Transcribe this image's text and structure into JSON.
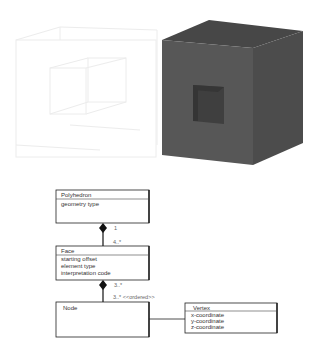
{
  "figure": {
    "wireframe_cube": {
      "label": "wireframe cube with hole",
      "stroke_color": "#e8e8e8"
    },
    "solid_cube": {
      "label": "solid cube with square hole",
      "front_color": "#555555",
      "top_color": "#4a4a4a",
      "side_color": "#4d4d4d",
      "hole_color": "#3e3e3e"
    }
  },
  "uml": {
    "polyhedron": {
      "name": "Polyhedron",
      "attributes": [
        "geometry type"
      ]
    },
    "face": {
      "name": "Face",
      "attributes": [
        "starting offset",
        "element type",
        "interpretation code"
      ]
    },
    "node": {
      "name": "Node",
      "attributes": []
    },
    "vertex": {
      "name": "Vertex",
      "attributes": [
        "x-coordinate",
        "y-coordinate",
        "z-coordinate"
      ]
    },
    "associations": {
      "polyhedron_face": {
        "source_multiplicity": "1",
        "target_multiplicity": "4..*"
      },
      "face_node": {
        "source_multiplicity": "3..*",
        "target_multiplicity": "3..* <<ordered>>"
      }
    }
  }
}
